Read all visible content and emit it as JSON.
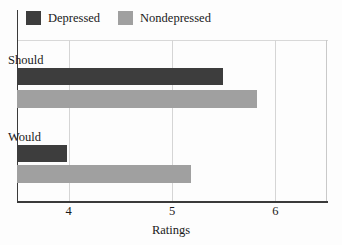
{
  "chart_data": {
    "type": "bar",
    "orientation": "horizontal",
    "title": "",
    "xlabel": "Ratings",
    "ylabel": "",
    "categories": [
      "Should",
      "Would"
    ],
    "series": [
      {
        "name": "Depressed",
        "color": "#3d3d3d",
        "values": [
          5.49,
          3.98
        ]
      },
      {
        "name": "Nondepressed",
        "color": "#a0a0a0",
        "values": [
          5.82,
          5.18
        ]
      }
    ],
    "xlim": [
      3.5,
      6.5
    ],
    "xticks": [
      4,
      5,
      6
    ],
    "xtick_labels": [
      "4",
      "5",
      "6"
    ],
    "grid": true,
    "grid_axis": "x",
    "legend_position": "top-left",
    "legend_entries": [
      "Depressed",
      "Nondepressed"
    ]
  },
  "legend": {
    "items": [
      {
        "label": "Depressed",
        "swatch": "legend-swatch-depressed"
      },
      {
        "label": "Nondepressed",
        "swatch": "legend-swatch-nondepressed"
      }
    ]
  },
  "axis": {
    "x_label": "Ratings",
    "ticks": [
      "4",
      "5",
      "6"
    ]
  },
  "groups": [
    {
      "label": "Should"
    },
    {
      "label": "Would"
    }
  ]
}
